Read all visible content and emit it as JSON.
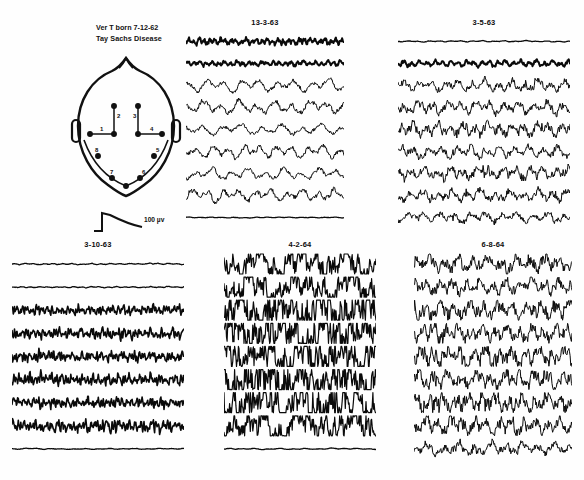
{
  "figure": {
    "patient_header": {
      "line1": "Ver T   born 7-12-62",
      "line2": "Tay Sachs Disease"
    },
    "calibration": {
      "label": "100 µv",
      "amplitude_uv": 100
    },
    "montage_diagram": {
      "name": "head-electrode-montage",
      "channel_numbers": [
        "1",
        "2",
        "3",
        "4",
        "5",
        "6",
        "7",
        "8"
      ],
      "view": "vertex / top-down head with ears"
    },
    "panels": [
      {
        "id": "panel-1963-03-13",
        "title": "13-3-63",
        "position": "top-middle",
        "channels": 9,
        "description": "low-to-medium voltage mixed activity, thick fast upper channels, slow rhythmic lower channels"
      },
      {
        "id": "panel-1963-03-05",
        "title": "3-5-63",
        "position": "top-right",
        "channels": 9,
        "description": "medium voltage irregular slow and sharp activity"
      },
      {
        "id": "panel-1963-03-10",
        "title": "3-10-63",
        "position": "bottom-left",
        "channels": 9,
        "description": "low voltage fast activity with fine tremulous rhythms"
      },
      {
        "id": "panel-1964-04-02",
        "title": "4-2-64",
        "position": "bottom-middle",
        "channels": 9,
        "description": "very high voltage chaotic slow waves and spikes, hypsarrhythmic pattern"
      },
      {
        "id": "panel-1964-06-08",
        "title": "6-8-64",
        "position": "bottom-right",
        "channels": 9,
        "description": "high voltage irregular slow waves with sharp transients"
      }
    ]
  },
  "chart_data": {
    "type": "line",
    "xlabel": "time",
    "ylabel": "amplitude (µv)",
    "grid": false,
    "legend": "none",
    "calibration_uv": 100,
    "panels": [
      {
        "title": "13-3-63",
        "series": [
          {
            "name": "ch1",
            "style": "fast-lowvolt",
            "amp": 3.0,
            "freq": 30,
            "rough": 1.6,
            "seed": 11
          },
          {
            "name": "ch2",
            "style": "fast-lowvolt",
            "amp": 2.6,
            "freq": 26,
            "rough": 1.2,
            "seed": 12
          },
          {
            "name": "ch3",
            "style": "slow-rhythmic",
            "amp": 6.5,
            "freq": 9,
            "rough": 0.7,
            "seed": 13
          },
          {
            "name": "ch4",
            "style": "slow-rhythmic",
            "amp": 7.0,
            "freq": 9,
            "rough": 0.8,
            "seed": 14
          },
          {
            "name": "ch5",
            "style": "slow-rhythmic",
            "amp": 6.0,
            "freq": 8,
            "rough": 0.7,
            "seed": 15
          },
          {
            "name": "ch6",
            "style": "slow-rhythmic",
            "amp": 6.8,
            "freq": 10,
            "rough": 0.8,
            "seed": 16
          },
          {
            "name": "ch7",
            "style": "slow-rhythmic",
            "amp": 6.2,
            "freq": 9,
            "rough": 0.7,
            "seed": 17
          },
          {
            "name": "ch8",
            "style": "slow-rhythmic",
            "amp": 6.6,
            "freq": 10,
            "rough": 0.9,
            "seed": 18
          },
          {
            "name": "ch9",
            "style": "flat",
            "amp": 1.2,
            "freq": 14,
            "rough": 0.5,
            "seed": 19
          }
        ]
      },
      {
        "title": "3-5-63",
        "series": [
          {
            "name": "ch1",
            "style": "flat",
            "amp": 1.6,
            "freq": 16,
            "rough": 0.6,
            "seed": 21
          },
          {
            "name": "ch2",
            "style": "fast-lowvolt",
            "amp": 3.2,
            "freq": 22,
            "rough": 1.1,
            "seed": 22
          },
          {
            "name": "ch3",
            "style": "sharp-mixed",
            "amp": 6.0,
            "freq": 13,
            "rough": 1.3,
            "seed": 23
          },
          {
            "name": "ch4",
            "style": "sharp-mixed",
            "amp": 6.4,
            "freq": 12,
            "rough": 1.4,
            "seed": 24
          },
          {
            "name": "ch5",
            "style": "sharp-mixed",
            "amp": 6.8,
            "freq": 14,
            "rough": 1.5,
            "seed": 25
          },
          {
            "name": "ch6",
            "style": "sharp-mixed",
            "amp": 6.2,
            "freq": 12,
            "rough": 1.3,
            "seed": 26
          },
          {
            "name": "ch7",
            "style": "sharp-mixed",
            "amp": 6.6,
            "freq": 13,
            "rough": 1.4,
            "seed": 27
          },
          {
            "name": "ch8",
            "style": "sharp-mixed",
            "amp": 6.0,
            "freq": 12,
            "rough": 1.3,
            "seed": 28
          },
          {
            "name": "ch9",
            "style": "sharp-mixed",
            "amp": 5.4,
            "freq": 11,
            "rough": 1.2,
            "seed": 29
          }
        ]
      },
      {
        "title": "3-10-63",
        "series": [
          {
            "name": "ch1",
            "style": "flat",
            "amp": 1.8,
            "freq": 18,
            "rough": 0.7,
            "seed": 31
          },
          {
            "name": "ch2",
            "style": "flat",
            "amp": 1.6,
            "freq": 20,
            "rough": 0.7,
            "seed": 32
          },
          {
            "name": "ch3",
            "style": "tremulous",
            "amp": 3.4,
            "freq": 34,
            "rough": 1.8,
            "seed": 33
          },
          {
            "name": "ch4",
            "style": "tremulous",
            "amp": 3.8,
            "freq": 32,
            "rough": 1.9,
            "seed": 34
          },
          {
            "name": "ch5",
            "style": "tremulous",
            "amp": 3.6,
            "freq": 36,
            "rough": 1.8,
            "seed": 35
          },
          {
            "name": "ch6",
            "style": "tremulous",
            "amp": 4.0,
            "freq": 33,
            "rough": 2.0,
            "seed": 36
          },
          {
            "name": "ch7",
            "style": "tremulous",
            "amp": 3.6,
            "freq": 35,
            "rough": 1.9,
            "seed": 37
          },
          {
            "name": "ch8",
            "style": "tremulous",
            "amp": 4.2,
            "freq": 31,
            "rough": 2.1,
            "seed": 38
          },
          {
            "name": "ch9",
            "style": "flat",
            "amp": 1.4,
            "freq": 14,
            "rough": 0.5,
            "seed": 39
          }
        ]
      },
      {
        "title": "4-2-64",
        "series": [
          {
            "name": "ch1",
            "style": "hypsarrhythmia",
            "amp": 11.0,
            "freq": 11,
            "rough": 2.2,
            "seed": 41
          },
          {
            "name": "ch2",
            "style": "hypsarrhythmia",
            "amp": 11.5,
            "freq": 10,
            "rough": 2.3,
            "seed": 42
          },
          {
            "name": "ch3",
            "style": "hypsarrhythmia",
            "amp": 12.5,
            "freq": 12,
            "rough": 2.8,
            "seed": 43
          },
          {
            "name": "ch4",
            "style": "hypsarrhythmia",
            "amp": 13.0,
            "freq": 11,
            "rough": 3.0,
            "seed": 44
          },
          {
            "name": "ch5",
            "style": "hypsarrhythmia",
            "amp": 12.0,
            "freq": 13,
            "rough": 2.9,
            "seed": 45
          },
          {
            "name": "ch6",
            "style": "hypsarrhythmia",
            "amp": 13.5,
            "freq": 12,
            "rough": 3.1,
            "seed": 46
          },
          {
            "name": "ch7",
            "style": "hypsarrhythmia",
            "amp": 12.5,
            "freq": 11,
            "rough": 2.9,
            "seed": 47
          },
          {
            "name": "ch8",
            "style": "hypsarrhythmia",
            "amp": 11.0,
            "freq": 10,
            "rough": 2.6,
            "seed": 48
          },
          {
            "name": "ch9",
            "style": "flat",
            "amp": 1.6,
            "freq": 12,
            "rough": 0.6,
            "seed": 49
          }
        ]
      },
      {
        "title": "6-8-64",
        "series": [
          {
            "name": "ch1",
            "style": "sharp-mixed",
            "amp": 8.0,
            "freq": 11,
            "rough": 1.7,
            "seed": 51
          },
          {
            "name": "ch2",
            "style": "sharp-mixed",
            "amp": 7.4,
            "freq": 12,
            "rough": 1.7,
            "seed": 52
          },
          {
            "name": "ch3",
            "style": "sharp-mixed",
            "amp": 8.4,
            "freq": 11,
            "rough": 1.9,
            "seed": 53
          },
          {
            "name": "ch4",
            "style": "sharp-mixed",
            "amp": 8.0,
            "freq": 13,
            "rough": 1.9,
            "seed": 54
          },
          {
            "name": "ch5",
            "style": "sharp-mixed",
            "amp": 8.8,
            "freq": 12,
            "rough": 2.0,
            "seed": 55
          },
          {
            "name": "ch6",
            "style": "sharp-mixed",
            "amp": 8.2,
            "freq": 11,
            "rough": 1.9,
            "seed": 56
          },
          {
            "name": "ch7",
            "style": "sharp-mixed",
            "amp": 8.6,
            "freq": 12,
            "rough": 2.0,
            "seed": 57
          },
          {
            "name": "ch8",
            "style": "sharp-mixed",
            "amp": 7.8,
            "freq": 13,
            "rough": 1.8,
            "seed": 58
          },
          {
            "name": "ch9",
            "style": "sharp-mixed",
            "amp": 6.0,
            "freq": 10,
            "rough": 1.5,
            "seed": 59
          }
        ]
      }
    ]
  }
}
